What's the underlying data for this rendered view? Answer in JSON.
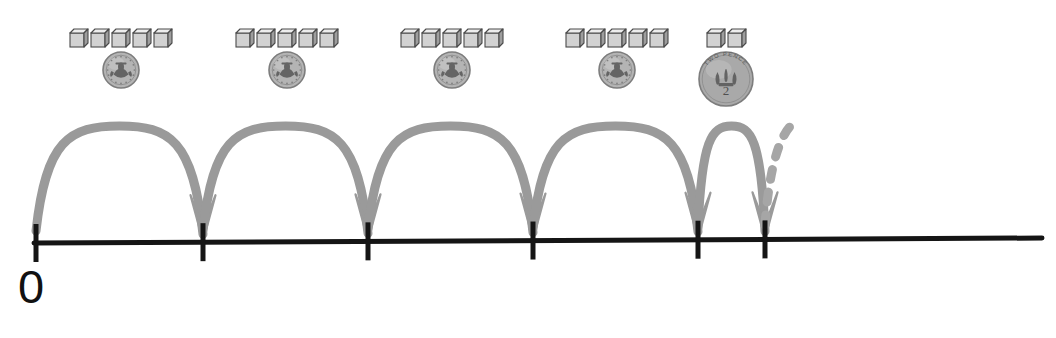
{
  "scene": {
    "title": "Number line skip counting with coins and cubes",
    "background_color": "#ffffff",
    "width": 1056,
    "height": 338
  },
  "colors": {
    "arc": "#9a9a9a",
    "arc_dash": "#a6a6a6",
    "number_line": "#151515",
    "tick": "#151515",
    "label_text": "#111111",
    "cube_face": "#d2d2d2",
    "cube_top": "#ededed",
    "cube_side": "#9e9e9e",
    "cube_outline": "#4a4a4a",
    "coin_5p_fill": "#b4b4b4",
    "coin_2p_fill": "#a9a9a9",
    "coin_rim": "#7d7d7d"
  },
  "number_line": {
    "label_zero": "0",
    "start_x": 36,
    "end_x": 1042,
    "y_left": 243,
    "y_right": 238,
    "stroke_width": 5,
    "ticks": [
      {
        "name": "tick-0",
        "x": 36,
        "value": "0"
      },
      {
        "name": "tick-1",
        "x": 203,
        "value": ""
      },
      {
        "name": "tick-2",
        "x": 368,
        "value": ""
      },
      {
        "name": "tick-3",
        "x": 533,
        "value": ""
      },
      {
        "name": "tick-4",
        "x": 698,
        "value": ""
      },
      {
        "name": "tick-5",
        "x": 765,
        "value": ""
      }
    ],
    "tick_half_height": 19
  },
  "jumps": [
    {
      "name": "jump-1",
      "from_x": 36,
      "to_x": 203,
      "peak_y": 126,
      "arrowhead": true,
      "dashed": false
    },
    {
      "name": "jump-2",
      "from_x": 203,
      "to_x": 368,
      "peak_y": 126,
      "arrowhead": true,
      "dashed": false
    },
    {
      "name": "jump-3",
      "from_x": 368,
      "to_x": 533,
      "peak_y": 126,
      "arrowhead": true,
      "dashed": false
    },
    {
      "name": "jump-4",
      "from_x": 533,
      "to_x": 698,
      "peak_y": 126,
      "arrowhead": true,
      "dashed": false
    },
    {
      "name": "jump-5",
      "from_x": 698,
      "to_x": 765,
      "peak_y": 126,
      "arrowhead": true,
      "dashed": false
    },
    {
      "name": "jump-6-partial",
      "from_x": 765,
      "to_x": 832,
      "peak_y": 126,
      "arrowhead": false,
      "dashed": true
    }
  ],
  "money_groups": [
    {
      "name": "money-group-1",
      "center_x": 121,
      "top_y": 28,
      "cube_count": 5,
      "coin": {
        "denomination": "5p",
        "face_text": "",
        "diameter": 38,
        "icon": "five-pence-coin-icon"
      }
    },
    {
      "name": "money-group-2",
      "center_x": 287,
      "top_y": 28,
      "cube_count": 5,
      "coin": {
        "denomination": "5p",
        "face_text": "",
        "diameter": 38,
        "icon": "five-pence-coin-icon"
      }
    },
    {
      "name": "money-group-3",
      "center_x": 452,
      "top_y": 28,
      "cube_count": 5,
      "coin": {
        "denomination": "5p",
        "face_text": "",
        "diameter": 38,
        "icon": "five-pence-coin-icon"
      }
    },
    {
      "name": "money-group-4",
      "center_x": 617,
      "top_y": 28,
      "cube_count": 5,
      "coin": {
        "denomination": "5p",
        "face_text": "",
        "diameter": 38,
        "icon": "five-pence-coin-icon"
      }
    },
    {
      "name": "money-group-5",
      "center_x": 726,
      "top_y": 28,
      "cube_count": 2,
      "coin": {
        "denomination": "2p",
        "face_text": "2",
        "legend_text": "TWO PENCE",
        "diameter": 56,
        "icon": "two-pence-coin-icon"
      }
    }
  ],
  "cube": {
    "width": 14,
    "height": 14,
    "depth": 4
  }
}
